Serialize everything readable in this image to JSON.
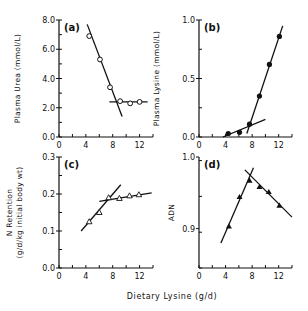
{
  "figure": {
    "xlabel": "Dietary Lysine (g/d)"
  },
  "chart_data": [
    {
      "type": "scatter",
      "panel": "(a)",
      "title": "(a)",
      "xlabel": "Dietary Lysine (g/d)",
      "ylabel": "Plasma Urea (mmol/L)",
      "xlim": [
        0,
        14
      ],
      "ylim": [
        0,
        8
      ],
      "xticks": [
        "0",
        "4",
        "8",
        "12"
      ],
      "yticks": [
        "0.0",
        "2.0",
        "4.0",
        "6.0",
        "8.0"
      ],
      "marker": "open-circle",
      "points": {
        "x": [
          4.5,
          6.1,
          7.6,
          9.1,
          10.6,
          12.0
        ],
        "y": [
          6.9,
          5.3,
          3.4,
          2.45,
          2.3,
          2.4
        ]
      },
      "fit_lines": [
        {
          "x": [
            4.2,
            9.4
          ],
          "y": [
            7.7,
            1.4
          ]
        },
        {
          "x": [
            7.5,
            13.2
          ],
          "y": [
            2.4,
            2.4
          ]
        }
      ],
      "grid": false
    },
    {
      "type": "scatter",
      "panel": "(b)",
      "title": "(b)",
      "xlabel": "Dietary Lysine (g/d)",
      "ylabel": "Plasma Lysine (mmol/L)",
      "xlim": [
        0,
        14
      ],
      "ylim": [
        0,
        1.0
      ],
      "xticks": [
        "0",
        "4",
        "8",
        "12"
      ],
      "yticks": [
        "0.0",
        "0.5",
        "1.0"
      ],
      "marker": "filled-circle",
      "points": {
        "x": [
          4.4,
          6.1,
          7.6,
          9.1,
          10.6,
          12.1
        ],
        "y": [
          0.03,
          0.04,
          0.11,
          0.35,
          0.62,
          0.86
        ]
      },
      "fit_lines": [
        {
          "x": [
            3.6,
            10.0
          ],
          "y": [
            0.0,
            0.15
          ]
        },
        {
          "x": [
            7.2,
            12.6
          ],
          "y": [
            0.03,
            0.95
          ]
        }
      ],
      "grid": false
    },
    {
      "type": "scatter",
      "panel": "(c)",
      "title": "(c)",
      "xlabel": "Dietary Lysine (g/d)",
      "ylabel": "N Retention",
      "ylabel2": "(g/d/kg initial body wt)",
      "xlim": [
        0,
        14
      ],
      "ylim": [
        0,
        0.3
      ],
      "xticks": [
        "0",
        "4",
        "8",
        "12"
      ],
      "yticks": [
        "0.0",
        "0.1",
        "0.2",
        "0.3"
      ],
      "marker": "open-triangle",
      "points": {
        "x": [
          4.5,
          6.0,
          7.4,
          9.0,
          10.5,
          11.9
        ],
        "y": [
          0.125,
          0.15,
          0.19,
          0.188,
          0.195,
          0.198
        ]
      },
      "fit_lines": [
        {
          "x": [
            3.3,
            9.2
          ],
          "y": [
            0.1,
            0.225
          ]
        },
        {
          "x": [
            6.0,
            13.8
          ],
          "y": [
            0.18,
            0.203
          ]
        }
      ],
      "grid": false
    },
    {
      "type": "scatter",
      "panel": "(d)",
      "title": "(d)",
      "xlabel": "Dietary Lysine (g/d)",
      "ylabel": "ADN",
      "xlim": [
        0,
        14
      ],
      "ylim": [
        0.845,
        1.0
      ],
      "xticks": [
        "0",
        "4",
        "8",
        "12"
      ],
      "yticks": [
        "0.9",
        "1.0"
      ],
      "marker": "filled-triangle",
      "points": {
        "x": [
          4.5,
          6.1,
          7.6,
          9.1,
          10.5,
          12.1
        ],
        "y": [
          0.903,
          0.944,
          0.967,
          0.958,
          0.951,
          0.932
        ]
      },
      "fit_lines": [
        {
          "x": [
            3.3,
            8.2
          ],
          "y": [
            0.88,
            0.985
          ]
        },
        {
          "x": [
            6.9,
            14.0
          ],
          "y": [
            0.982,
            0.916
          ]
        }
      ],
      "grid": false
    }
  ]
}
